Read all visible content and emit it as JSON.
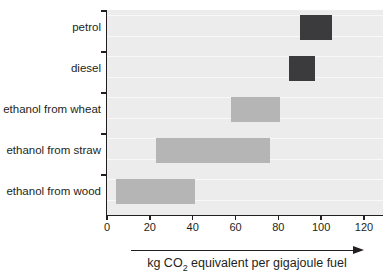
{
  "chart_data": {
    "type": "bar",
    "subtype": "horizontal-range-bars",
    "title": "",
    "xlabel": "kg CO2 equivalent per gigajoule fuel",
    "xlabel_parts": {
      "pre": "kg CO",
      "sub": "2",
      "post": " equivalent per gigajoule fuel"
    },
    "categories": [
      "petrol",
      "diesel",
      "ethanol from wheat",
      "ethanol from straw",
      "ethanol from wood"
    ],
    "series": [
      {
        "name": "petrol",
        "range": [
          90,
          105
        ],
        "color": "#3b3b3d"
      },
      {
        "name": "diesel",
        "range": [
          85,
          97
        ],
        "color": "#3b3b3d"
      },
      {
        "name": "ethanol from wheat",
        "range": [
          58,
          81
        ],
        "color": "#b5b5b6"
      },
      {
        "name": "ethanol from straw",
        "range": [
          23,
          76
        ],
        "color": "#b5b5b6"
      },
      {
        "name": "ethanol from wood",
        "range": [
          4,
          41
        ],
        "color": "#b5b5b6"
      }
    ],
    "xlim": [
      0,
      120
    ],
    "x_ticks": [
      "0",
      "20",
      "40",
      "60",
      "80",
      "100",
      "120"
    ],
    "x_tick_values": [
      0,
      20,
      40,
      60,
      80,
      100,
      120
    ],
    "grid": "faint horizontal white lines on light-grey plot background",
    "legend": "none",
    "colors": {
      "fossil_bar": "#3b3b3d",
      "ethanol_bar": "#b5b5b6",
      "plot_background": "#ececec",
      "gridline": "#f8f8f8",
      "axis_and_text": "#231f20",
      "page_background": "#ffffff"
    }
  }
}
